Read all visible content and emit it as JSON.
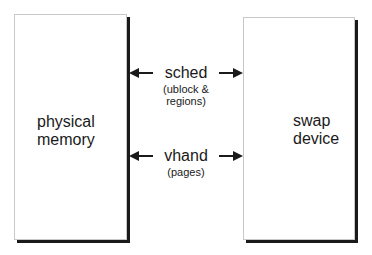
{
  "diagram": {
    "left_box": {
      "label_line1": "physical",
      "label_line2": "memory"
    },
    "right_box": {
      "label_line1": "swap",
      "label_line2": "device"
    },
    "arrows": [
      {
        "label": "sched",
        "sublabel_line1": "(ublock &",
        "sublabel_line2": "regions)",
        "direction": "bidirectional"
      },
      {
        "label": "vhand",
        "sublabel_line1": "(pages)",
        "direction": "bidirectional"
      }
    ]
  }
}
